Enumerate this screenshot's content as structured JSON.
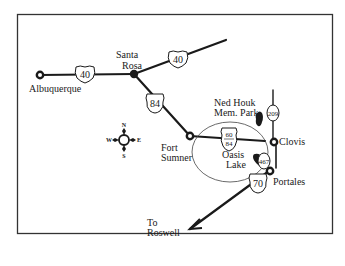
{
  "map": {
    "title": "",
    "border_color": "#333333",
    "road_color": "#1a1a1a",
    "cities": [
      {
        "name": "Albuquerque",
        "x": 40,
        "y": 75
      },
      {
        "name": "Santa Rosa",
        "x": 134,
        "y": 74
      },
      {
        "name": "Fort Sumner",
        "x": 190,
        "y": 136
      },
      {
        "name": "Clovis",
        "x": 272,
        "y": 142
      },
      {
        "name": "Portales",
        "x": 269,
        "y": 171
      }
    ],
    "labels": {
      "albuquerque": "Albuquerque",
      "santa_rosa_1": "Santa",
      "santa_rosa_2": "Rosa",
      "fort_sumner_1": "Fort",
      "fort_sumner_2": "Sumner",
      "clovis": "Clovis",
      "portales": "Portales",
      "ned_houk_1": "Ned Houk",
      "ned_houk_2": "Mem. Park",
      "oasis_1": "Oasis",
      "oasis_2": "Lake",
      "roswell_1": "To",
      "roswell_2": "Roswell"
    },
    "routes": [
      {
        "id": "I-40 west",
        "shield": "40",
        "type": "interstate"
      },
      {
        "id": "I-40 east",
        "shield": "40",
        "type": "interstate"
      },
      {
        "id": "US-84",
        "shield": "84",
        "type": "us"
      },
      {
        "id": "US-60/84",
        "shield_top": "60",
        "shield_bottom": "84",
        "type": "us"
      },
      {
        "id": "NM-209",
        "shield": "209",
        "type": "state"
      },
      {
        "id": "NM-467",
        "shield": "467",
        "type": "state"
      },
      {
        "id": "US-70",
        "shield": "70",
        "type": "us"
      }
    ],
    "compass": {
      "n": "N",
      "s": "S",
      "e": "E",
      "w": "W"
    }
  }
}
